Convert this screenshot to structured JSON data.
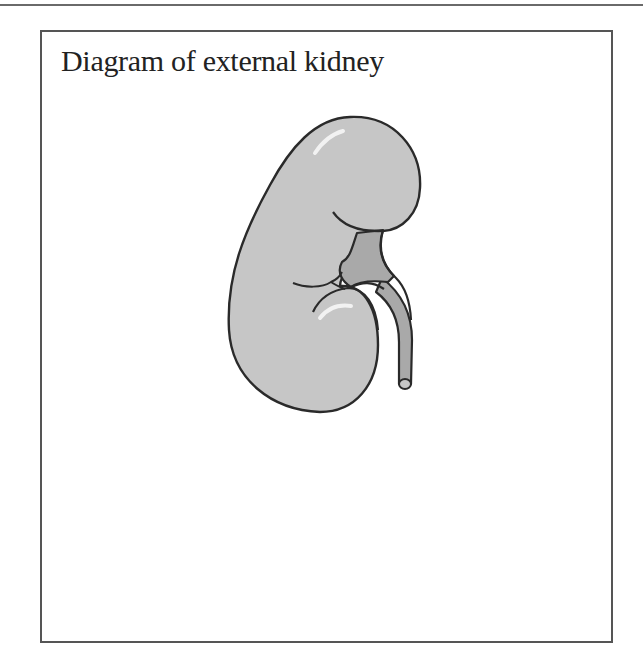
{
  "diagram": {
    "title": "Diagram of external kidney",
    "parts": [
      "upper-lobe",
      "lower-lobe",
      "renal-pelvis",
      "ureter"
    ],
    "colors": {
      "kidney_fill": "#c6c6c6",
      "pelvis_fill": "#a9a9a9",
      "outline": "#2a2a2a",
      "highlight": "#f2f2f2",
      "frame": "#555555"
    }
  }
}
